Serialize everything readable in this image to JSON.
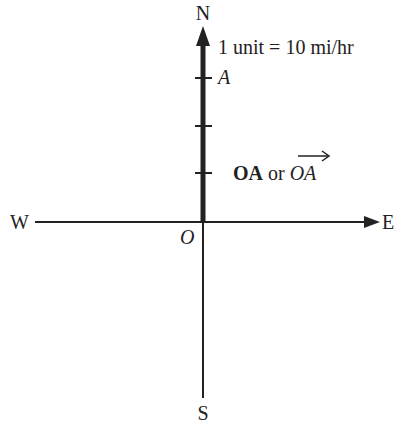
{
  "diagram": {
    "compass": {
      "north": "N",
      "south": "S",
      "east": "E",
      "west": "W"
    },
    "origin_label": "O",
    "point_label": "A",
    "scale_label": "1 unit = 10 mi/hr",
    "vector_label": {
      "bold": "OA",
      "connector": " or ",
      "italic": "OA",
      "arrow": "→"
    },
    "vector": {
      "from": "O",
      "to": "A",
      "direction": "N",
      "length_units": 3,
      "magnitude": "30 mi/hr"
    },
    "colors": {
      "ink": "#222222",
      "background": "#ffffff"
    }
  }
}
